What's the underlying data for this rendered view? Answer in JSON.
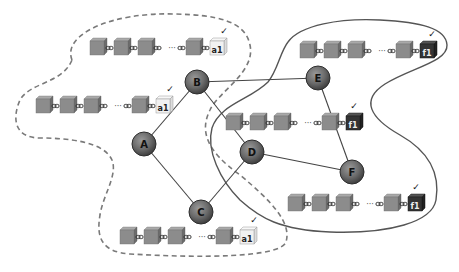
{
  "diagram": {
    "colors": {
      "node_fill": "#6e6e6e",
      "node_stroke": "#333333",
      "edge": "#444444",
      "block_front": "#8a8a8a",
      "block_top": "#a8a8a8",
      "block_side": "#6a6a6a",
      "tip_a1_front": "#f2f2f2",
      "tip_a1_stroke": "#999999",
      "tip_f1_front": "#333333",
      "partition_dashed": "#777777",
      "partition_solid": "#555555"
    },
    "nodes": [
      {
        "id": "A",
        "label": "A",
        "x": 144,
        "y": 144
      },
      {
        "id": "B",
        "label": "B",
        "x": 197,
        "y": 82
      },
      {
        "id": "C",
        "label": "C",
        "x": 201,
        "y": 212
      },
      {
        "id": "D",
        "label": "D",
        "x": 252,
        "y": 152
      },
      {
        "id": "E",
        "label": "E",
        "x": 318,
        "y": 78
      },
      {
        "id": "F",
        "label": "F",
        "x": 352,
        "y": 172
      }
    ],
    "edges": [
      {
        "from": "A",
        "to": "B"
      },
      {
        "from": "A",
        "to": "C"
      },
      {
        "from": "B",
        "to": "E"
      },
      {
        "from": "B",
        "to": "D"
      },
      {
        "from": "C",
        "to": "D"
      },
      {
        "from": "D",
        "to": "F"
      },
      {
        "from": "E",
        "to": "F"
      }
    ],
    "partitions": [
      {
        "name": "partition-a",
        "style": "dashed",
        "members": [
          "A",
          "B",
          "C"
        ],
        "tip_label": "a1"
      },
      {
        "name": "partition-f",
        "style": "solid",
        "members": [
          "D",
          "E",
          "F"
        ],
        "tip_label": "f1"
      }
    ],
    "chains": [
      {
        "name": "chain-top-left",
        "owner": "B",
        "tip": "a1",
        "tip_style": "light",
        "check": "✓",
        "ellipsis": "···"
      },
      {
        "name": "chain-left",
        "owner": "A",
        "tip": "a1",
        "tip_style": "light",
        "check": "✓",
        "ellipsis": "···"
      },
      {
        "name": "chain-bottom",
        "owner": "C",
        "tip": "a1",
        "tip_style": "light",
        "check": "✓",
        "ellipsis": "···"
      },
      {
        "name": "chain-top-right",
        "owner": "E",
        "tip": "f1",
        "tip_style": "dark",
        "check": "✓",
        "ellipsis": "···"
      },
      {
        "name": "chain-middle",
        "owner": "D",
        "tip": "f1",
        "tip_style": "dark",
        "check": "✓",
        "ellipsis": "···"
      },
      {
        "name": "chain-bottom-right",
        "owner": "F",
        "tip": "f1",
        "tip_style": "dark",
        "check": "✓",
        "ellipsis": "···"
      }
    ]
  }
}
